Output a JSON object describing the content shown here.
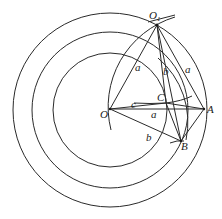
{
  "diagram": {
    "type": "geometric-construction",
    "center": {
      "x": 110,
      "y": 110
    },
    "circles": [
      {
        "name": "outer-circle",
        "r": 97
      },
      {
        "name": "middle-circle",
        "r": 78
      },
      {
        "name": "inner-circle",
        "r": 57
      }
    ],
    "points": {
      "O": {
        "x": 110,
        "y": 109,
        "label": "O"
      },
      "O1": {
        "x": 157,
        "y": 25,
        "label": "O",
        "subscript": "1"
      },
      "A": {
        "x": 204,
        "y": 109,
        "label": "A"
      },
      "B": {
        "x": 181,
        "y": 141,
        "label": "B"
      },
      "C": {
        "x": 166,
        "y": 103,
        "label": "C"
      }
    },
    "edge_labels": {
      "O_O1": "a",
      "O1_C": "b",
      "O1_A": "a",
      "O_A": "a",
      "O_B": "b",
      "O_C": "c"
    }
  }
}
